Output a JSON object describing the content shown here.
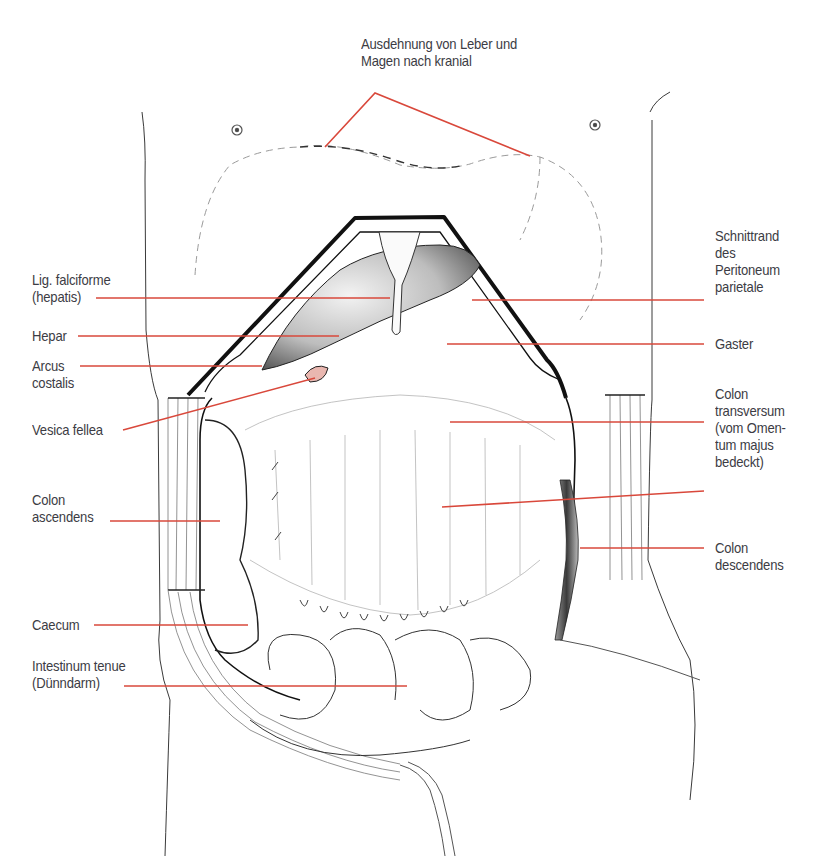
{
  "figure": {
    "leader_color": "#d9483b",
    "ink_color": "#1a1a1a",
    "labels": {
      "top": [
        "Ausdehnung von Leber und",
        "Magen nach kranial"
      ],
      "lig_falciforme": [
        "Lig. falciforme",
        "(hepatis)"
      ],
      "hepar": [
        "Hepar"
      ],
      "arcus_costalis": [
        "Arcus",
        "costalis"
      ],
      "vesica_fellea": [
        "Vesica fellea"
      ],
      "colon_ascendens": [
        "Colon",
        "ascendens"
      ],
      "caecum": [
        "Caecum"
      ],
      "intestinum_tenue": [
        "Intestinum tenue",
        "(Dünndarm)"
      ],
      "schnittrand": [
        "Schnittrand",
        "des",
        "Peritoneum",
        "parietale"
      ],
      "gaster": [
        "Gaster"
      ],
      "colon_transversum": [
        "Colon",
        "transversum",
        "(vom Omen-",
        "tum majus",
        "bedeckt)"
      ],
      "colon_descendens": [
        "Colon",
        "descendens"
      ]
    }
  }
}
